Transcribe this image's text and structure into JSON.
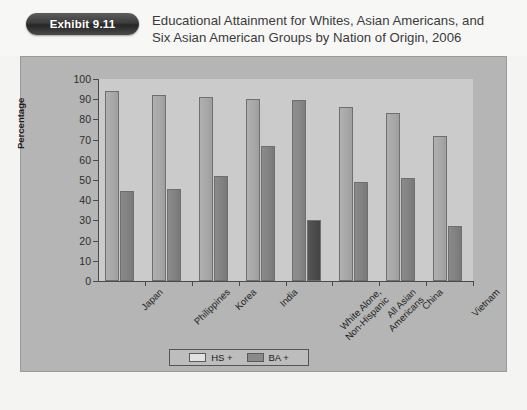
{
  "exhibit": {
    "badge_label": "Exhibit 9.11"
  },
  "title": {
    "line1": "Educational Attainment for Whites, Asian Americans, and",
    "line2": "Six Asian American Groups by Nation of Origin, 2006"
  },
  "colors": {
    "page_background": "#f4f4f3",
    "panel_background": "#b5b5b5",
    "plot_background": "#cbcbcb",
    "badge_background": "#3c3c3c",
    "badge_text": "#ffffff",
    "title_text": "#3b3b3b",
    "axis": "#4a4a4a",
    "series_hs": "#a8a8a8",
    "series_ba": "#828282",
    "series_hs_highlight": "#878787",
    "series_ba_highlight": "#4c4c4c"
  },
  "chart_data": {
    "type": "bar",
    "title": "Educational Attainment for Whites, Asian Americans, and Six Asian American Groups by Nation of Origin, 2006",
    "xlabel": "",
    "ylabel": "Percentage",
    "ylim": [
      0,
      100
    ],
    "yticks": [
      0,
      10,
      20,
      30,
      40,
      50,
      60,
      70,
      80,
      90,
      100
    ],
    "grid": false,
    "legend_position": "bottom-center",
    "categories": [
      "Japan",
      "Philippines",
      "Korea",
      "India",
      "White Alone, Non-Hispanic",
      "All Asian Americans",
      "China",
      "Vietnam"
    ],
    "category_lines": [
      [
        "Japan"
      ],
      [
        "Philippines"
      ],
      [
        "Korea"
      ],
      [
        "India"
      ],
      [
        "White Alone,",
        "Non-Hispanic"
      ],
      [
        "All Asian",
        "Americans"
      ],
      [
        "China"
      ],
      [
        "Vietnam"
      ]
    ],
    "series": [
      {
        "name": "HS +",
        "values": [
          94,
          92,
          91,
          90,
          89.5,
          86,
          83,
          72
        ]
      },
      {
        "name": "BA +",
        "values": [
          44.5,
          45.5,
          52,
          67,
          30,
          49,
          51,
          27
        ]
      }
    ],
    "highlight_category_index": 4
  },
  "yaxis": {
    "labels": [
      "100",
      "90",
      "80",
      "70",
      "60",
      "50",
      "40",
      "30",
      "20",
      "10",
      "0"
    ],
    "title": "Percentage"
  },
  "legend": {
    "items": [
      {
        "label": "HS +",
        "swatch": "hs"
      },
      {
        "label": "BA +",
        "swatch": "ba"
      }
    ]
  }
}
